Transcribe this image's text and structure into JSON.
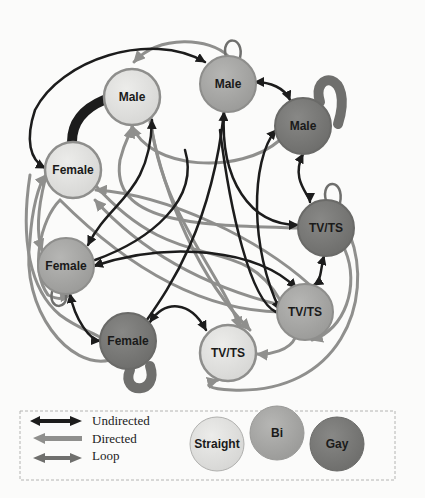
{
  "colors": {
    "straight": "#e2e2e0",
    "bi": "#a9a9a7",
    "gay": "#7b7b79",
    "straight_stroke": "#8e8e8c",
    "undirected": "#1c1c1c",
    "directed": "#8f8f8d",
    "loop": "#6f6f6d",
    "background": "#fbfbfa"
  },
  "nodes": [
    {
      "id": "n1",
      "label": "Male",
      "orientation": "straight",
      "x": 132,
      "y": 97
    },
    {
      "id": "n2",
      "label": "Male",
      "orientation": "bi",
      "x": 228,
      "y": 84
    },
    {
      "id": "n3",
      "label": "Male",
      "orientation": "gay",
      "x": 303,
      "y": 126
    },
    {
      "id": "n4",
      "label": "Female",
      "orientation": "straight",
      "x": 73,
      "y": 170
    },
    {
      "id": "n5",
      "label": "TV/TS",
      "orientation": "gay",
      "x": 326,
      "y": 228
    },
    {
      "id": "n6",
      "label": "Female",
      "orientation": "bi",
      "x": 66,
      "y": 266
    },
    {
      "id": "n7",
      "label": "TV/TS",
      "orientation": "bi",
      "x": 305,
      "y": 312
    },
    {
      "id": "n8",
      "label": "Female",
      "orientation": "gay",
      "x": 128,
      "y": 341
    },
    {
      "id": "n9",
      "label": "TV/TS",
      "orientation": "straight",
      "x": 228,
      "y": 353
    }
  ],
  "legend": {
    "edge_types": [
      {
        "label": "Undirected",
        "type": "undirected"
      },
      {
        "label": "Directed",
        "type": "directed"
      },
      {
        "label": "Loop",
        "type": "loop"
      }
    ],
    "orientations": [
      {
        "label": "Straight",
        "type": "straight"
      },
      {
        "label": "Bi",
        "type": "bi"
      },
      {
        "label": "Gay",
        "type": "gay"
      }
    ]
  }
}
